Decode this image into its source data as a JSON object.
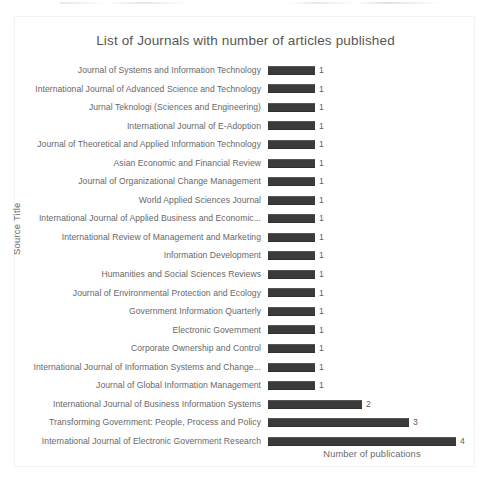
{
  "chart_data": {
    "type": "bar",
    "orientation": "horizontal",
    "title": "List of Journals with number of articles published",
    "xlabel": "Number of publications",
    "ylabel": "Source Title",
    "grid": false,
    "legend": null,
    "xlim": [
      0,
      4
    ],
    "bar_color": "#3b3b3b",
    "categories": [
      "Journal of Systems and Information Technology",
      "International Journal of Advanced Science and Technology",
      "Jurnal Teknologi (Sciences and Engineering)",
      "International Journal of E-Adoption",
      "Journal of Theoretical and Applied Information Technology",
      "Asian Economic and Financial Review",
      "Journal of Organizational Change Management",
      "World Applied Sciences Journal",
      "International Journal of Applied Business and Economic...",
      "International Review of Management and Marketing",
      "Information Development",
      "Humanities and Social Sciences Reviews",
      "Journal of Environmental Protection and Ecology",
      "Government Information Quarterly",
      "Electronic Government",
      "Corporate Ownership and Control",
      "International Journal of Information Systems and Change...",
      "Journal of Global Information Management",
      "International Journal of Business Information Systems",
      "Transforming Government: People, Process and Policy",
      "International Journal of Electronic Government Research"
    ],
    "values": [
      1,
      1,
      1,
      1,
      1,
      1,
      1,
      1,
      1,
      1,
      1,
      1,
      1,
      1,
      1,
      1,
      1,
      1,
      2,
      3,
      4
    ],
    "data_labels": [
      "1",
      "1",
      "1",
      "1",
      "1",
      "1",
      "1",
      "1",
      "1",
      "1",
      "1",
      "1",
      "1",
      "1",
      "1",
      "1",
      "1",
      "1",
      "2",
      "3",
      "4"
    ]
  }
}
